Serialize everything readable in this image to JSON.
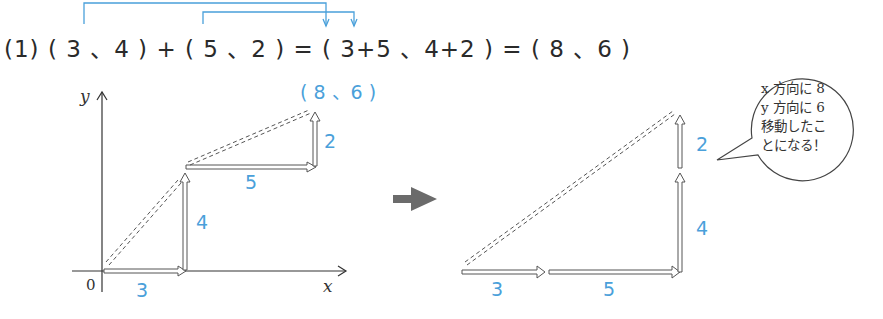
{
  "equation": {
    "number": "(1)",
    "text": "( 3 、4 ) + ( 5 、2 ) = ( 3+5 、4+2 ) = ( 8 、6 )",
    "part_a": "( 3 、4 )",
    "plus": "+",
    "part_b": "( 5 、2 )",
    "eq1": "=",
    "sum": "( 3+5 、4+2 )",
    "eq2": "=",
    "result": "( 8 、6 )"
  },
  "left_diagram": {
    "y_axis_label": "y",
    "x_axis_label": "x",
    "origin_label": "0",
    "endpoint_label": "( 8 、6 )",
    "vectors": [
      {
        "label": "3",
        "dir": "x"
      },
      {
        "label": "4",
        "dir": "y"
      },
      {
        "label": "5",
        "dir": "x"
      },
      {
        "label": "2",
        "dir": "y"
      }
    ]
  },
  "transition_arrow": "right-arrow",
  "right_diagram": {
    "vectors": [
      {
        "label": "3",
        "dir": "x"
      },
      {
        "label": "5",
        "dir": "x"
      },
      {
        "label": "4",
        "dir": "y"
      },
      {
        "label": "2",
        "dir": "y"
      }
    ],
    "speech_bubble": {
      "lines": [
        "x 方向に 8",
        "y 方向に 6",
        "移動したこ",
        "とになる！"
      ]
    }
  },
  "colors": {
    "accent_blue": "#4aa0da",
    "line": "#333333",
    "arrow_gray": "#6b6b6b"
  }
}
